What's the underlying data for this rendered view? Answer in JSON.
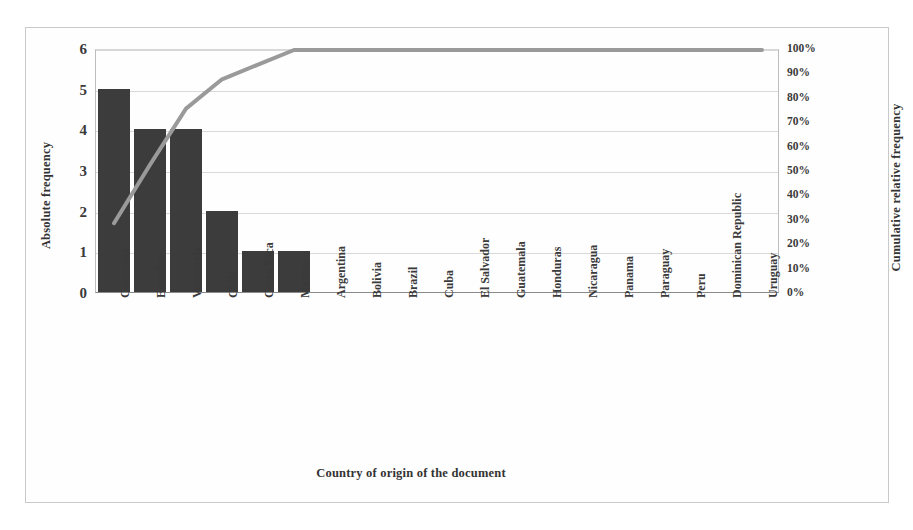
{
  "chart_data": {
    "type": "bar",
    "title": "",
    "subtitle": "",
    "xlabel": "Country of origin of the document",
    "ylabel": "Absolute frequency",
    "y2label": "Cumulative relative frequency",
    "categories": [
      "Colombia",
      "Ecuador",
      "Venezuela",
      "Chile",
      "Costa Rica",
      "Mexico",
      "Argentina",
      "Bolivia",
      "Brazil",
      "Cuba",
      "El Salvador",
      "Guatemala",
      "Honduras",
      "Nicaragua",
      "Panama",
      "Paraguay",
      "Peru",
      "Dominican Republic",
      "Uruguay"
    ],
    "series": [
      {
        "name": "Absolute frequency",
        "kind": "bar",
        "axis": "left",
        "values": [
          5,
          4,
          4,
          2,
          1,
          1,
          0,
          0,
          0,
          0,
          0,
          0,
          0,
          0,
          0,
          0,
          0,
          0,
          0
        ]
      },
      {
        "name": "Cumulative relative frequency",
        "kind": "line",
        "axis": "right",
        "values": [
          29,
          53,
          76,
          88,
          94,
          100,
          100,
          100,
          100,
          100,
          100,
          100,
          100,
          100,
          100,
          100,
          100,
          100,
          100
        ]
      }
    ],
    "ylim": [
      0,
      6
    ],
    "yticks": [
      "0",
      "1",
      "2",
      "3",
      "4",
      "5",
      "6"
    ],
    "y2lim": [
      0,
      100
    ],
    "y2ticks": [
      "0%",
      "10%",
      "20%",
      "30%",
      "40%",
      "50%",
      "60%",
      "70%",
      "80%",
      "90%",
      "100%"
    ],
    "grid": true,
    "legend": "none",
    "colors": {
      "bar": "#3c3c3c",
      "line": "#9a9a9a",
      "grid": "#d9d9d9",
      "axis": "#8a8a8a",
      "frame": "#c9c9c9",
      "text": "#3a3a3a"
    }
  }
}
